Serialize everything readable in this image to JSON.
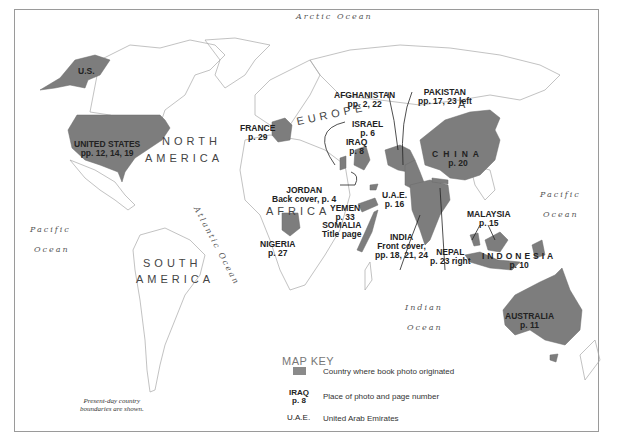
{
  "map": {
    "fill_color": "#7d7d7d",
    "outline_color": "#9a9a9a",
    "oceans": [
      {
        "label": "Arctic Ocean"
      },
      {
        "label": "Pacific"
      },
      {
        "label": "Ocean"
      },
      {
        "label": "Pacific"
      },
      {
        "label": "Ocean"
      },
      {
        "label": "Atlantic Ocean"
      },
      {
        "label": "Indian"
      },
      {
        "label": "Ocean"
      }
    ],
    "continents": {
      "north_america_1": "NORTH",
      "north_america_2": "AMERICA",
      "south_america_1": "SOUTH",
      "south_america_2": "AMERICA",
      "europe": "EUROPE",
      "africa": "AFRICA",
      "asia": "A"
    },
    "countries": [
      {
        "name": "U.S.",
        "page": ""
      },
      {
        "name": "UNITED STATES",
        "page": "pp. 12, 14, 19"
      },
      {
        "name": "FRANCE",
        "page": "p. 29"
      },
      {
        "name": "AFGHANISTAN",
        "page": "pp. 2, 22"
      },
      {
        "name": "PAKISTAN",
        "page": "pp. 17, 23 left"
      },
      {
        "name": "ISRAEL",
        "page": "p. 6"
      },
      {
        "name": "IRAQ",
        "page": "p. 8"
      },
      {
        "name": "CHINA",
        "page": "p. 20"
      },
      {
        "name": "JORDAN",
        "page": "Back cover, p. 4"
      },
      {
        "name": "U.A.E.",
        "page": "p. 16"
      },
      {
        "name": "YEMEN",
        "page": "p. 33"
      },
      {
        "name": "SOMALIA",
        "page": "Title page"
      },
      {
        "name": "NIGERIA",
        "page": "p. 27"
      },
      {
        "name": "INDIA",
        "page": "Front cover,",
        "page2": "pp. 18, 21, 24"
      },
      {
        "name": "NEPAL",
        "page": "p. 23 right"
      },
      {
        "name": "MALAYSIA",
        "page": "p. 15"
      },
      {
        "name": "INDONESIA",
        "page": "p. 10"
      },
      {
        "name": "AUSTRALIA",
        "page": "p. 11"
      }
    ],
    "note_line1": "Present-day country",
    "note_line2": "boundaries are shown."
  },
  "map_key": {
    "title": "MAP KEY",
    "items": [
      {
        "symbol": "gray-swatch",
        "label": "Country where book photo originated"
      },
      {
        "symbol": "IRAQ",
        "symbol2": "p. 8",
        "label": "Place of photo and page number"
      },
      {
        "symbol": "U.A.E.",
        "label": "United Arab Emirates"
      }
    ]
  }
}
